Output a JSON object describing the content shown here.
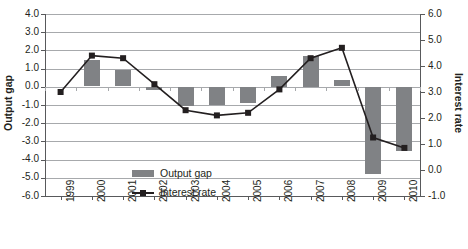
{
  "chart_data": {
    "type": "bar",
    "title": "",
    "xlabel": "",
    "ylabel": "Output gap",
    "y2label": "Interest rate",
    "categories": [
      "1999",
      "2000",
      "2001",
      "2002",
      "2003",
      "2004",
      "2005",
      "2006",
      "2007",
      "2008",
      "2009",
      "2010"
    ],
    "ylim": [
      -6.0,
      4.0
    ],
    "y2lim": [
      -1.0,
      6.0
    ],
    "yticks": [
      "4.0",
      "3.0",
      "2.0",
      "1.0",
      "0.0",
      "-1.0",
      "-2.0",
      "-3.0",
      "-4.0",
      "-5.0",
      "-6.0"
    ],
    "ytick_values": [
      4.0,
      3.0,
      2.0,
      1.0,
      0.0,
      -1.0,
      -2.0,
      -3.0,
      -4.0,
      -5.0,
      -6.0
    ],
    "y2ticks": [
      "6.0",
      "5.0",
      "4.0",
      "3.0",
      "2.0",
      "1.0",
      "0.0",
      "-1.0"
    ],
    "y2tick_values": [
      6.0,
      5.0,
      4.0,
      3.0,
      2.0,
      1.0,
      0.0,
      -1.0
    ],
    "grid": true,
    "legend_position": "inside-lower-center",
    "series": [
      {
        "name": "Output gap",
        "type": "bar",
        "axis": "left",
        "color": "#808285",
        "values": [
          0.0,
          1.45,
          0.9,
          -0.15,
          -1.05,
          -1.0,
          -0.9,
          0.6,
          1.7,
          0.35,
          -4.8,
          -3.5
        ]
      },
      {
        "name": "Interest rate",
        "type": "line",
        "axis": "right",
        "color": "#231f20",
        "marker": "square",
        "values": [
          3.0,
          4.4,
          4.3,
          3.3,
          2.3,
          2.1,
          2.2,
          3.1,
          4.3,
          4.7,
          1.25,
          0.85
        ]
      }
    ]
  },
  "legend": {
    "items": [
      {
        "label": "Output gap",
        "marker": "bar-swatch",
        "color": "#808285"
      },
      {
        "label": "Interest rate",
        "marker": "line-square",
        "color": "#231f20"
      }
    ]
  },
  "axes": {
    "left_title": "Output gap",
    "right_title": "Interest rate"
  }
}
